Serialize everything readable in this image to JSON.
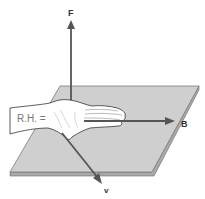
{
  "diagram": {
    "title": "",
    "labels": {
      "force": "F",
      "field": "B",
      "velocity": "v",
      "hand": "R.H. ="
    },
    "colors": {
      "plate": "#c8c8c8",
      "plate_edge": "#8a8a8a",
      "arrow": "#555555",
      "hand": "#ffffff",
      "outline": "#333333"
    }
  }
}
